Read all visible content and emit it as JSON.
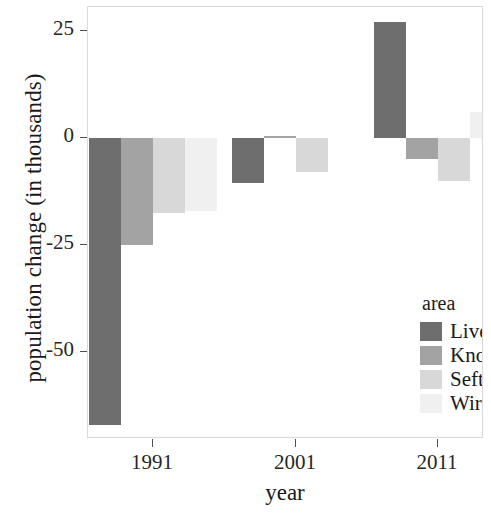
{
  "chart_data": {
    "type": "bar",
    "title": "",
    "subtitle": "",
    "xlabel": "year",
    "ylabel": "population change (in thousands)",
    "categories": [
      "1991",
      "2001",
      "2011"
    ],
    "series": [
      {
        "name": "Liverpool",
        "color": "#6e6e6e",
        "values": [
          -67.0,
          -10.5,
          27.0
        ]
      },
      {
        "name": "Knowsley",
        "color": "#a3a3a3",
        "values": [
          -25.0,
          0.5,
          -5.0
        ]
      },
      {
        "name": "Sefton",
        "color": "#d8d8d8",
        "values": [
          -17.5,
          -8.0,
          -10.0
        ]
      },
      {
        "name": "Wirral",
        "color": "#f0f0f0",
        "values": [
          -17.0,
          0.0,
          6.0
        ]
      }
    ],
    "legend_title": "area",
    "legend_position": "inside-bottom-right",
    "ylim": [
      -72,
      30
    ],
    "yticks": [
      25,
      0,
      -25,
      -50
    ],
    "ytick_labels": [
      "25",
      "0",
      "-25",
      "-50"
    ],
    "xticks": [
      "1991",
      "2001",
      "2011"
    ],
    "grid": false,
    "panel_background": "#ffffff",
    "axis_color": "#4d4d4d"
  },
  "axes": {
    "y_title": "population change (in thousands)",
    "x_title": "year"
  },
  "legend": {
    "title": "area",
    "entries": [
      {
        "label": "Liverpool",
        "color": "#6e6e6e"
      },
      {
        "label": "Knowsley",
        "color": "#a3a3a3"
      },
      {
        "label": "Sefton",
        "color": "#d8d8d8"
      },
      {
        "label": "Wirral",
        "color": "#f0f0f0"
      }
    ]
  }
}
